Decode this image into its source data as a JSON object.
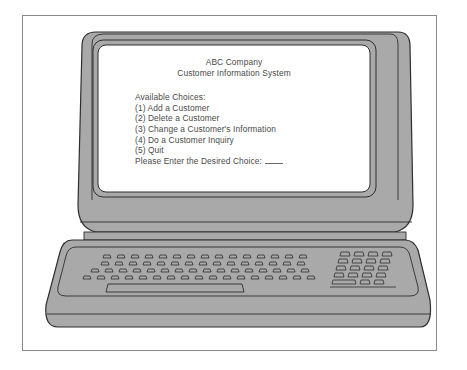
{
  "screen": {
    "company": "ABC Company",
    "system_name": "Customer Information System",
    "menu_heading": "Available Choices:",
    "choices": [
      {
        "label": "(1) Add a Customer"
      },
      {
        "label": "(2) Delete a Customer"
      },
      {
        "label": "(3) Change a Customer's Information"
      },
      {
        "label": "(4) Do a Customer Inquiry"
      },
      {
        "label": "(5) Quit"
      }
    ],
    "prompt": "Please Enter the Desired Choice:",
    "input_value": ""
  },
  "colors": {
    "body_gray": "#a9a9a9",
    "outline": "#2e2e2e",
    "screen": "#ffffff",
    "frame": "#8a8a8a"
  }
}
